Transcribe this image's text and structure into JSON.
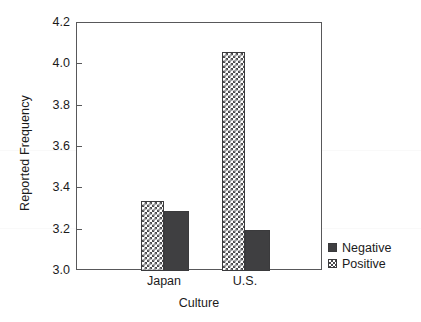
{
  "chart_data": {
    "type": "bar",
    "title": "",
    "xlabel": "Culture",
    "ylabel": "Reported Frequency",
    "categories": [
      "Japan",
      "U.S."
    ],
    "series": [
      {
        "name": "Negative",
        "values": [
          3.29,
          3.2
        ],
        "swatch": "solid-dark",
        "color": "#3f3f41"
      },
      {
        "name": "Positive",
        "values": [
          3.34,
          4.06
        ],
        "swatch": "checkered",
        "color": "#ffffff"
      }
    ],
    "ylim": [
      3.0,
      4.2
    ],
    "yticks": [
      "3.0",
      "3.2",
      "3.4",
      "3.6",
      "3.8",
      "4.0",
      "4.2"
    ],
    "ytick_values": [
      3.0,
      3.2,
      3.4,
      3.6,
      3.8,
      4.0,
      4.2
    ],
    "grid": false,
    "legend_position": "right-bottom",
    "legend_entries": [
      "Negative",
      "Positive"
    ],
    "bar_order_in_group": [
      "Positive",
      "Negative"
    ]
  },
  "axes": {
    "y_title": "Reported Frequency",
    "x_title": "Culture",
    "y_ticks": [
      {
        "label": "4.2",
        "value": 4.2
      },
      {
        "label": "4.0",
        "value": 4.0
      },
      {
        "label": "3.8",
        "value": 3.8
      },
      {
        "label": "3.6",
        "value": 3.6
      },
      {
        "label": "3.4",
        "value": 3.4
      },
      {
        "label": "3.2",
        "value": 3.2
      },
      {
        "label": "3.0",
        "value": 3.0
      }
    ],
    "x_ticks": [
      {
        "label": "Japan"
      },
      {
        "label": "U.S."
      }
    ]
  },
  "legend": {
    "items": [
      {
        "label": "Negative",
        "style": "solid-dark"
      },
      {
        "label": "Positive",
        "style": "checkered"
      }
    ]
  },
  "colors": {
    "negative_fill": "#3f3f41",
    "positive_fill": "#ffffff",
    "positive_pattern": "#4a4a4c",
    "axis": "#58585a",
    "text": "#1b1b1b",
    "background": "#ffffff"
  }
}
